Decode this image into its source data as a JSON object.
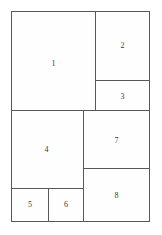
{
  "diagram": {
    "type": "rectangle-packing",
    "title": "",
    "background_color": "#ffffff",
    "stroke_color": "#58585a",
    "fill_color": "#fefefe",
    "label_color": "#3a3a3c",
    "outer_frame": {
      "x": 11,
      "y": 11,
      "width": 139,
      "height": 211
    },
    "regions": [
      {
        "id": "1",
        "label": "1",
        "x": 0,
        "y": 0,
        "width": 85,
        "height": 100
      },
      {
        "id": "2",
        "label": "2",
        "x": 84,
        "y": 0,
        "width": 55,
        "height": 70
      },
      {
        "id": "3",
        "label": "3",
        "x": 84,
        "y": 69,
        "width": 55,
        "height": 31
      },
      {
        "id": "4",
        "label": "4",
        "x": 0,
        "y": 99,
        "width": 73,
        "height": 79
      },
      {
        "id": "5",
        "label": "5",
        "x": 0,
        "y": 177,
        "width": 38,
        "height": 34
      },
      {
        "id": "6",
        "label": "6",
        "x": 37,
        "y": 177,
        "width": 36,
        "height": 34
      },
      {
        "id": "7",
        "label": "7",
        "x": 72,
        "y": 99,
        "width": 67,
        "height": 59
      },
      {
        "id": "8",
        "label": "8",
        "x": 72,
        "y": 157,
        "width": 67,
        "height": 54
      }
    ]
  }
}
